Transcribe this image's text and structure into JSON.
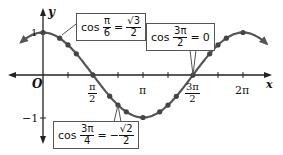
{
  "diagram": {
    "axes": {
      "x_label": "x",
      "y_label": "y",
      "origin_label": "O"
    },
    "y_ticks": [
      {
        "label": "1",
        "value": 1
      },
      {
        "label": "−1",
        "value": -1
      }
    ],
    "x_ticks": [
      {
        "num": "π",
        "den": "2",
        "value": "π/2"
      },
      {
        "num": "π",
        "den": "",
        "value": "π"
      },
      {
        "num": "3π",
        "den": "2",
        "value": "3π/2"
      },
      {
        "num": "2π",
        "den": "",
        "value": "2π"
      }
    ],
    "callouts": [
      {
        "func": "cos",
        "arg_num": "π",
        "arg_den": "6",
        "eq": "=",
        "sign": "",
        "val_num": "√3",
        "val_den": "2",
        "text": "cos π/6 = √3/2"
      },
      {
        "func": "cos",
        "arg_num": "3π",
        "arg_den": "2",
        "eq": "=",
        "sign": "",
        "val": "0",
        "text": "cos 3π/2 = 0"
      },
      {
        "func": "cos",
        "arg_num": "3π",
        "arg_den": "4",
        "eq": "=",
        "sign": "−",
        "val_num": "√2",
        "val_den": "2",
        "text": "cos 3π/4 = −√2/2"
      }
    ],
    "colors": {
      "curve": "#555555",
      "axis": "#222222",
      "point": "#444444"
    }
  },
  "chart_data": {
    "type": "line",
    "xlabel": "x",
    "ylabel": "y",
    "x_tick_labels": [
      "π/2",
      "π",
      "3π/2",
      "2π"
    ],
    "y_tick_labels": [
      "1",
      "−1"
    ],
    "xlim": [
      "-π/4",
      "9π/4"
    ],
    "ylim": [
      -1.3,
      1.3
    ],
    "grid": false,
    "series": [
      {
        "name": "cos x",
        "function": "cos(x)"
      }
    ],
    "marked_points": [
      {
        "x": "0",
        "y": 1
      },
      {
        "x": "π/6",
        "y": 0.866
      },
      {
        "x": "π/4",
        "y": 0.707
      },
      {
        "x": "π/3",
        "y": 0.5
      },
      {
        "x": "π/2",
        "y": 0
      },
      {
        "x": "2π/3",
        "y": -0.5
      },
      {
        "x": "3π/4",
        "y": -0.707
      },
      {
        "x": "5π/6",
        "y": -0.866
      },
      {
        "x": "π",
        "y": -1
      },
      {
        "x": "7π/6",
        "y": -0.866
      },
      {
        "x": "5π/4",
        "y": -0.707
      },
      {
        "x": "4π/3",
        "y": -0.5
      },
      {
        "x": "3π/2",
        "y": 0
      },
      {
        "x": "5π/3",
        "y": 0.5
      },
      {
        "x": "7π/4",
        "y": 0.707
      },
      {
        "x": "11π/6",
        "y": 0.866
      },
      {
        "x": "2π",
        "y": 1
      }
    ],
    "annotations": [
      "cos π/6 = √3/2",
      "cos 3π/2 = 0",
      "cos 3π/4 = −√2/2"
    ]
  }
}
